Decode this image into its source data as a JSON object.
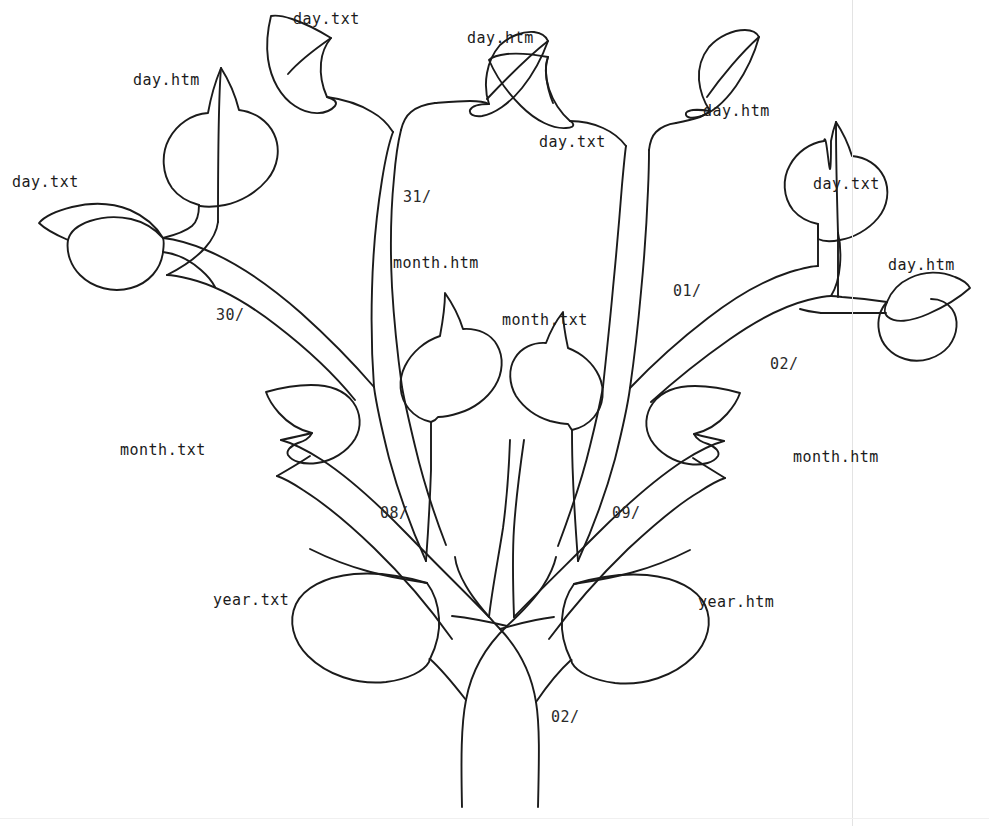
{
  "canvas": {
    "width": 989,
    "height": 826,
    "background": "#ffffff",
    "ink_color": "#1b1b1b"
  },
  "diagram": {
    "kind": "hand-drawn directory tree"
  },
  "leaf_labels": [
    {
      "id": "leaf-day-txt-far-left",
      "text": "day.txt",
      "x": 12,
      "y": 175
    },
    {
      "id": "leaf-day-htm-upper-left",
      "text": "day.htm",
      "x": 133,
      "y": 73
    },
    {
      "id": "leaf-day-txt-top-left",
      "text": "day.txt",
      "x": 293,
      "y": 12
    },
    {
      "id": "leaf-day-htm-top-mid",
      "text": "day.htm",
      "x": 467,
      "y": 31
    },
    {
      "id": "leaf-day-txt-mid-right",
      "text": "day.txt",
      "x": 539,
      "y": 135
    },
    {
      "id": "leaf-day-htm-upper-right",
      "text": "day.htm",
      "x": 703,
      "y": 104
    },
    {
      "id": "leaf-day-txt-right",
      "text": "day.txt",
      "x": 813,
      "y": 177
    },
    {
      "id": "leaf-day-htm-far-right",
      "text": "day.htm",
      "x": 888,
      "y": 258
    },
    {
      "id": "leaf-month-htm-center",
      "text": "month.htm",
      "x": 393,
      "y": 256
    },
    {
      "id": "leaf-month-txt-center",
      "text": "month.txt",
      "x": 502,
      "y": 313
    },
    {
      "id": "leaf-month-txt-left",
      "text": "month.txt",
      "x": 120,
      "y": 443
    },
    {
      "id": "leaf-month-htm-right",
      "text": "month.htm",
      "x": 793,
      "y": 450
    },
    {
      "id": "leaf-year-txt-left",
      "text": "year.txt",
      "x": 213,
      "y": 593
    },
    {
      "id": "leaf-year-htm-right",
      "text": "year.htm",
      "x": 698,
      "y": 595
    }
  ],
  "edge_labels": [
    {
      "id": "edge-30",
      "text": "30/",
      "x": 216,
      "y": 308
    },
    {
      "id": "edge-31",
      "text": "31/",
      "x": 403,
      "y": 190
    },
    {
      "id": "edge-01",
      "text": "01/",
      "x": 673,
      "y": 284
    },
    {
      "id": "edge-02-right",
      "text": "02/",
      "x": 770,
      "y": 357
    },
    {
      "id": "edge-08",
      "text": "08/",
      "x": 380,
      "y": 506
    },
    {
      "id": "edge-09",
      "text": "09/",
      "x": 612,
      "y": 506
    },
    {
      "id": "edge-02-trunk",
      "text": "02/",
      "x": 551,
      "y": 710
    }
  ],
  "artifacts": {
    "seam_x": 852,
    "seam_color": "#e3e3e3",
    "bottom_edge_y": 818,
    "bottom_ghost_y": 818,
    "bottom_ghost_text": "                                                                                                    "
  }
}
